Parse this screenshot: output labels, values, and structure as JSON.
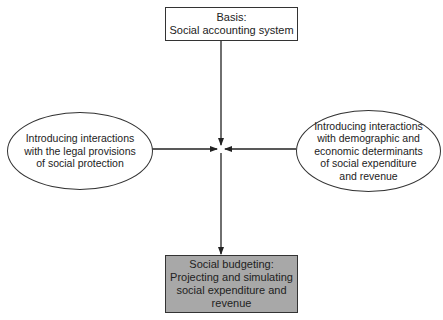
{
  "nodes": {
    "top": {
      "text": "Basis:\nSocial accounting system",
      "fill": "#ffffff"
    },
    "left": {
      "text": "Introducing interactions\nwith the legal provisions\nof social protection",
      "fill": "#ffffff"
    },
    "right": {
      "text": "Introducing interactions\nwith demographic and\neconomic determinants\nof social expenditure\nand revenue",
      "fill": "#ffffff"
    },
    "bottom": {
      "text": "Social budgeting:\nProjecting and simulating\nsocial expenditure and\nrevenue",
      "fill": "#a8a8a8"
    }
  },
  "edges": [
    {
      "from": "top",
      "to": "center"
    },
    {
      "from": "left",
      "to": "center"
    },
    {
      "from": "right",
      "to": "center"
    },
    {
      "from": "center",
      "to": "bottom"
    }
  ]
}
